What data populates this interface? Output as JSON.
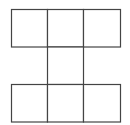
{
  "diagram": {
    "title": "",
    "shape": "grid of unit squares",
    "stroke_color": "#444444",
    "fill_color": "#ffffff",
    "rows": [
      [
        1,
        1,
        1
      ],
      [
        0,
        1,
        0
      ],
      [
        1,
        1,
        1
      ]
    ]
  }
}
